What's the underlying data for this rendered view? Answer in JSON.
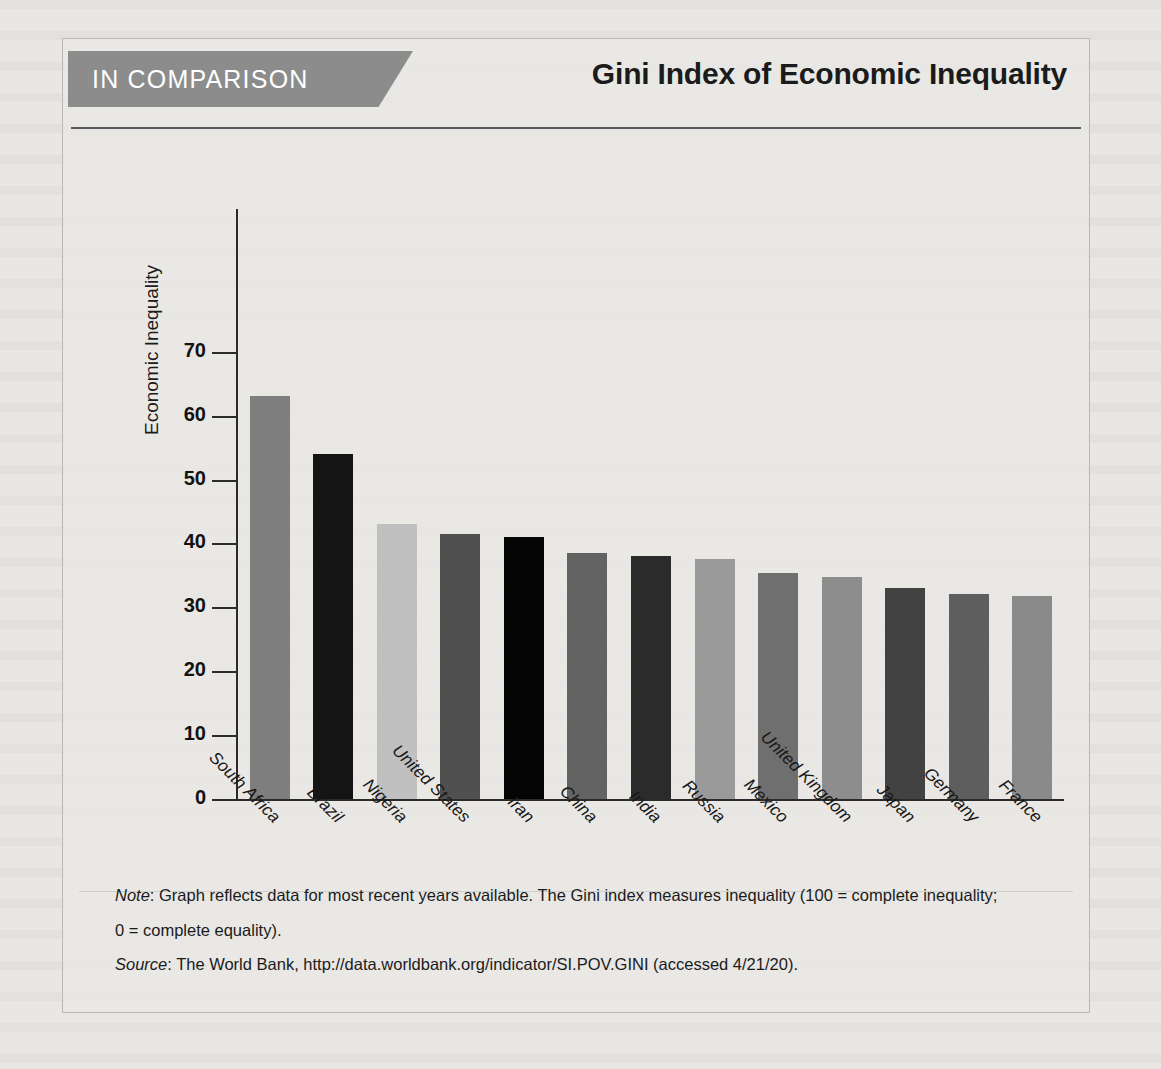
{
  "header": {
    "banner_label": "IN COMPARISON",
    "title": "Gini Index of Economic Inequality"
  },
  "chart_data": {
    "type": "bar",
    "title": "Gini Index of Economic Inequality",
    "xlabel": "",
    "ylabel": "Economic Inequality",
    "ylim": [
      0,
      75
    ],
    "yticks": [
      0,
      10,
      20,
      30,
      40,
      50,
      60,
      70
    ],
    "grid": false,
    "legend": "none",
    "categories": [
      "South Africa",
      "Brazil",
      "Nigeria",
      "United States",
      "Iran",
      "China",
      "India",
      "Russia",
      "Mexico",
      "United Kingdom",
      "Japan",
      "Germany",
      "France"
    ],
    "values": [
      63.0,
      54.0,
      43.0,
      41.5,
      41.0,
      38.5,
      38.0,
      37.6,
      35.4,
      34.8,
      33.0,
      32.1,
      31.7
    ],
    "bar_colors": [
      "#7e7e7e",
      "#141414",
      "#c0c0c0",
      "#505050",
      "#050505",
      "#636363",
      "#2b2b2b",
      "#9a9a9a",
      "#6f6f6f",
      "#8d8d8d",
      "#424242",
      "#5e5e5e",
      "#8a8a8a"
    ]
  },
  "notes": {
    "note_label": "Note",
    "note_text": ": Graph reflects data for most recent years available. The Gini index measures inequality (100 = complete inequality;",
    "note_text_line2": "0 = complete equality).",
    "source_label": "Source",
    "source_text": ": The World Bank, http://data.worldbank.org/indicator/SI.POV.GINI (accessed 4/21/20)."
  },
  "colors": {
    "banner_bg": "#8c8c8c",
    "page_bg": "#e8e7e4",
    "axis": "#2b2b2b",
    "rule": "#55565a"
  }
}
